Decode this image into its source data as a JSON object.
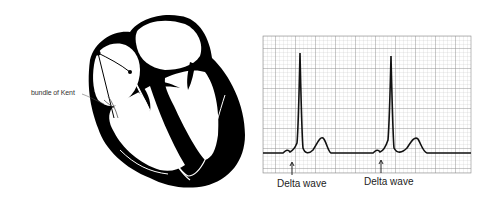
{
  "figure": {
    "heart": {
      "label_accessory_pathway": "bundle of Kent"
    },
    "ecg": {
      "annotations": [
        {
          "label": "Delta wave",
          "beat": 1
        },
        {
          "label": "Delta wave",
          "beat": 2
        }
      ],
      "colors": {
        "grid_minor": "#c8c8c8",
        "grid_major": "#8c8c8c",
        "trace": "#111111",
        "background": "#ffffff"
      }
    }
  }
}
